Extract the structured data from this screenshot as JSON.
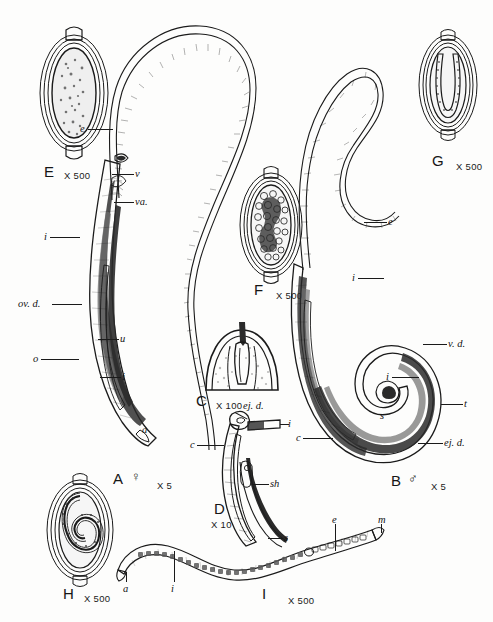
{
  "plate": {
    "title": "Trichuris morphology plate",
    "background_color": "#fdfdfc",
    "ink_color": "#1b1b1b"
  },
  "panels": [
    {
      "id": "E",
      "letter": "E",
      "magnification": "X 500",
      "subject": "unsegmented egg with bipolar plugs",
      "sex": "",
      "labels": []
    },
    {
      "id": "A",
      "letter": "A",
      "magnification": "X 5",
      "subject": "adult female whipworm",
      "sex": "♀",
      "labels": [
        {
          "text": "e",
          "meaning": "esophagus"
        },
        {
          "text": "v",
          "meaning": "vulva"
        },
        {
          "text": "va.",
          "meaning": "vagina"
        },
        {
          "text": "i",
          "meaning": "intestine"
        },
        {
          "text": "ov. d.",
          "meaning": "oviduct"
        },
        {
          "text": "u",
          "meaning": "uterus"
        },
        {
          "text": "o",
          "meaning": "ovary"
        },
        {
          "text": "i",
          "meaning": "intestine"
        },
        {
          "text": "a",
          "meaning": "anus"
        }
      ]
    },
    {
      "id": "F",
      "letter": "F",
      "magnification": "X 500",
      "subject": "egg in cleavage",
      "sex": "",
      "labels": []
    },
    {
      "id": "C",
      "letter": "C",
      "magnification": "X 100",
      "subject": "anterior end, stichosome region",
      "sex": "",
      "labels": []
    },
    {
      "id": "D",
      "letter": "D",
      "magnification": "X 10",
      "subject": "male posterior end, spicule and sheath",
      "sex": "",
      "labels": [
        {
          "text": "ej. d.",
          "meaning": "ejaculatory duct"
        },
        {
          "text": "i",
          "meaning": "intestine"
        },
        {
          "text": "c",
          "meaning": "cloaca"
        },
        {
          "text": "sh",
          "meaning": "spicule sheath"
        },
        {
          "text": "s",
          "meaning": "spicule"
        }
      ]
    },
    {
      "id": "G",
      "letter": "G",
      "magnification": "X 500",
      "subject": "egg containing U-shaped larva",
      "sex": "",
      "labels": []
    },
    {
      "id": "B",
      "letter": "B",
      "magnification": "X 5",
      "subject": "adult male whipworm with coiled tail",
      "sex": "♂",
      "labels": [
        {
          "text": "e",
          "meaning": "esophagus"
        },
        {
          "text": "i",
          "meaning": "intestine"
        },
        {
          "text": "v. d.",
          "meaning": "vas deferens"
        },
        {
          "text": "i",
          "meaning": "intestine"
        },
        {
          "text": "t",
          "meaning": "testis"
        },
        {
          "text": "ej. d.",
          "meaning": "ejaculatory duct"
        },
        {
          "text": "s",
          "meaning": "spicule"
        },
        {
          "text": "c",
          "meaning": "cloaca"
        }
      ]
    },
    {
      "id": "H",
      "letter": "H",
      "magnification": "X 500",
      "subject": "egg containing coiled larva",
      "sex": "",
      "labels": []
    },
    {
      "id": "I",
      "letter": "I",
      "magnification": "X 500",
      "subject": "hatched first stage larva",
      "sex": "",
      "labels": [
        {
          "text": "a",
          "meaning": "anus"
        },
        {
          "text": "i",
          "meaning": "intestine"
        },
        {
          "text": "e",
          "meaning": "esophagus"
        },
        {
          "text": "m",
          "meaning": "mouth"
        }
      ]
    }
  ]
}
